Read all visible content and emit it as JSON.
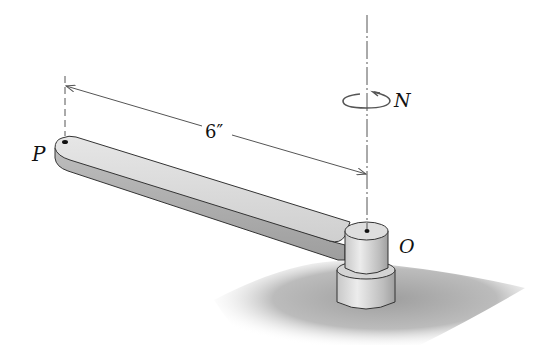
{
  "figure": {
    "type": "mechanics-diagram",
    "labels": {
      "point_p": "P",
      "point_o": "O",
      "rotation": "N",
      "dimension": "6″"
    },
    "colors": {
      "line": "#555555",
      "arm_top": "#dcdcdc",
      "arm_side": "#b8b8b8",
      "hub_light": "#e2e2e2",
      "hub_dark": "#a9a9a9",
      "shadow": "#9a9a9a",
      "text": "#111111"
    }
  }
}
